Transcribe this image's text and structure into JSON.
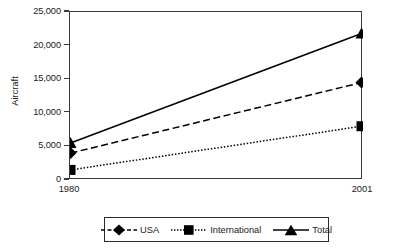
{
  "chart_data": {
    "type": "line",
    "title": "",
    "xlabel": "",
    "ylabel": "Aircraft",
    "categories": [
      "1980",
      "2001"
    ],
    "x": [
      1980,
      2001
    ],
    "xlim": [
      1980,
      2001
    ],
    "ylim": [
      0,
      25000
    ],
    "ytick_values": [
      0,
      5000,
      10000,
      15000,
      20000,
      25000
    ],
    "ytick_labels": [
      "0",
      "5,000",
      "10,000",
      "15,000",
      "20,000",
      "25,000"
    ],
    "xtick_labels": [
      "1980",
      "2001"
    ],
    "grid": false,
    "legend_position": "bottom",
    "series": [
      {
        "name": "USA",
        "values": [
          4000,
          14500
        ],
        "marker": "diamond",
        "linestyle": "dashed",
        "color": "#000000"
      },
      {
        "name": "International",
        "values": [
          1500,
          8000
        ],
        "marker": "square",
        "linestyle": "dotted",
        "color": "#000000"
      },
      {
        "name": "Total",
        "values": [
          5500,
          21800
        ],
        "marker": "triangle",
        "linestyle": "solid",
        "color": "#000000"
      }
    ]
  },
  "legend": {
    "items": [
      {
        "label": "USA",
        "marker": "diamond-marker",
        "linestyle": "dashed"
      },
      {
        "label": "International",
        "marker": "square-marker",
        "linestyle": "dotted"
      },
      {
        "label": "Total",
        "marker": "triangle-marker",
        "linestyle": "solid"
      }
    ]
  },
  "axes": {
    "y_title": "Aircraft",
    "y_ticks": [
      "25,000",
      "20,000",
      "15,000",
      "10,000",
      "5,000",
      "0"
    ],
    "x_ticks": [
      "1980",
      "2001"
    ]
  },
  "colors": {
    "ink": "#000000",
    "axis": "#3a3a3a",
    "background": "#ffffff"
  }
}
